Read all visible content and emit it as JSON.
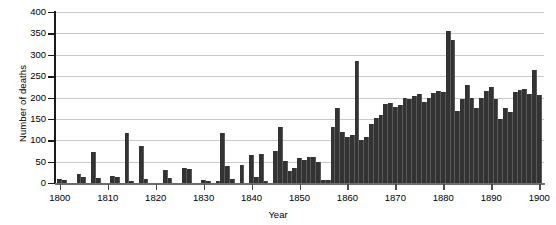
{
  "chart_data": {
    "type": "bar",
    "title": "",
    "xlabel": "Year",
    "ylabel": "Number of deaths",
    "xlim": [
      1799,
      1901
    ],
    "ylim": [
      0,
      400
    ],
    "grid": true,
    "legend": null,
    "bar_color": "#333333",
    "y_ticks": [
      0,
      50,
      100,
      150,
      200,
      250,
      300,
      350,
      400
    ],
    "x_ticks": [
      1800,
      1810,
      1820,
      1830,
      1840,
      1850,
      1860,
      1870,
      1880,
      1890,
      1900
    ],
    "x": [
      1800,
      1801,
      1802,
      1803,
      1804,
      1805,
      1806,
      1807,
      1808,
      1809,
      1810,
      1811,
      1812,
      1813,
      1814,
      1815,
      1816,
      1817,
      1818,
      1819,
      1820,
      1821,
      1822,
      1823,
      1824,
      1825,
      1826,
      1827,
      1828,
      1829,
      1830,
      1831,
      1832,
      1833,
      1834,
      1835,
      1836,
      1837,
      1838,
      1839,
      1840,
      1841,
      1842,
      1843,
      1844,
      1845,
      1846,
      1847,
      1848,
      1849,
      1850,
      1851,
      1852,
      1853,
      1854,
      1855,
      1856,
      1857,
      1858,
      1859,
      1860,
      1861,
      1862,
      1863,
      1864,
      1865,
      1866,
      1867,
      1868,
      1869,
      1870,
      1871,
      1872,
      1873,
      1874,
      1875,
      1876,
      1877,
      1878,
      1879,
      1880,
      1881,
      1882,
      1883,
      1884,
      1885,
      1886,
      1887,
      1888,
      1889,
      1890,
      1891,
      1892,
      1893,
      1894,
      1895,
      1896,
      1897,
      1898,
      1899,
      1900
    ],
    "values": [
      10,
      8,
      0,
      0,
      22,
      15,
      0,
      72,
      12,
      0,
      0,
      16,
      14,
      0,
      118,
      5,
      0,
      86,
      10,
      0,
      0,
      0,
      30,
      12,
      0,
      0,
      35,
      33,
      0,
      0,
      6,
      5,
      0,
      4,
      118,
      40,
      10,
      0,
      42,
      0,
      66,
      14,
      68,
      4,
      0,
      75,
      130,
      52,
      28,
      36,
      58,
      55,
      60,
      62,
      50,
      8,
      6,
      130,
      175,
      120,
      108,
      112,
      285,
      100,
      108,
      138,
      152,
      160,
      186,
      188,
      178,
      182,
      200,
      196,
      204,
      208,
      190,
      200,
      210,
      215,
      214,
      355,
      335,
      168,
      196,
      230,
      200,
      175,
      200,
      215,
      225,
      196,
      150,
      176,
      165,
      212,
      218,
      220,
      208,
      265,
      205
    ]
  }
}
